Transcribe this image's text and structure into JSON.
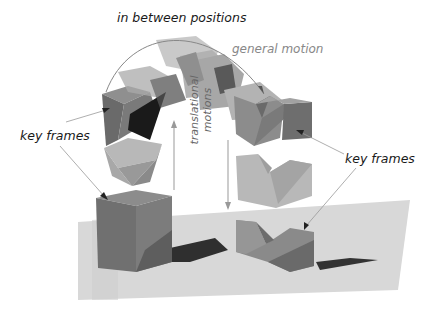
{
  "labels": {
    "in_between": "in between positions",
    "general_motion": "general motion",
    "key_frames_left": "key frames",
    "key_frames_right": "key frames",
    "translational_1": "translational",
    "translational_2": "motions"
  },
  "colors": {
    "ground": "#d6d6d6",
    "cube_dark": "#6e6e6e",
    "cube_mid": "#8a8a8a",
    "cube_light": "#b4b4b4",
    "shadow": "#2e2e2e",
    "annotation_line": "#9a9a9a",
    "text_dark": "#1a1a1a",
    "text_gray": "#888888"
  }
}
